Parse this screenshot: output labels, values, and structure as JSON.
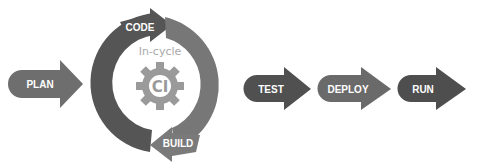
{
  "diagram": {
    "stages": {
      "plan": {
        "label": "PLAN",
        "color": "#6e6e6e"
      },
      "code": {
        "label": "CODE",
        "color": "#555555"
      },
      "build": {
        "label": "BUILD",
        "color": "#7a7a7a"
      },
      "test": {
        "label": "TEST",
        "color": "#505050"
      },
      "deploy": {
        "label": "DEPLOY",
        "color": "#6a6a6a"
      },
      "run": {
        "label": "RUN",
        "color": "#4e4e4e"
      }
    },
    "cycle": {
      "caption": "In-cycle",
      "center_label": "CI",
      "gear_color": "#9a9a9a"
    }
  }
}
